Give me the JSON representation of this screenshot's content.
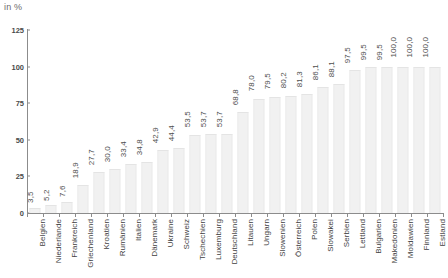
{
  "unit_label": "in %",
  "colors": {
    "bar_fill": "#f1f1f1",
    "bar_edge": "#e7e7e7",
    "axis": "#8c8c8c",
    "text": "#3f3f3f"
  },
  "chart_data": {
    "type": "bar",
    "title": "",
    "subtitle": "in %",
    "xlabel": "",
    "ylabel": "in %",
    "ylim": [
      0,
      125
    ],
    "yticks": [
      0,
      25,
      50,
      75,
      100,
      125
    ],
    "ytick_labels": [
      "0",
      "25",
      "50",
      "75",
      "100",
      "125"
    ],
    "grid": false,
    "legend": null,
    "value_label_decimal_separator": ",",
    "categories": [
      "Belgien",
      "Niederlande",
      "Frankreich",
      "Griechenland",
      "Kroatien",
      "Rumänien",
      "Italien",
      "Dänemark",
      "Ukraine",
      "Schweiz",
      "Tschechien",
      "Luxemburg",
      "Deutschland",
      "Litauen",
      "Ungarn",
      "Slowenien",
      "Österreich",
      "Polen",
      "Slowakei",
      "Serbien",
      "Lettland",
      "Bulgarien",
      "Makedonien",
      "Moldawien",
      "Finnland",
      "Estland"
    ],
    "values": [
      3.5,
      5.2,
      7.6,
      18.9,
      27.7,
      30.0,
      33.4,
      34.8,
      42.9,
      44.4,
      53.5,
      53.7,
      53.7,
      68.8,
      78.0,
      79.5,
      80.2,
      81.3,
      86.1,
      88.1,
      97.5,
      99.5,
      99.5,
      100.0,
      100.0,
      100.0
    ],
    "value_labels": [
      "3,5",
      "5,2",
      "7,6",
      "18,9",
      "27,7",
      "30,0",
      "33,4",
      "34,8",
      "42,9",
      "44,4",
      "53,5",
      "53,7",
      "53,7",
      "68,8",
      "78,0",
      "79,5",
      "80,2",
      "81,3",
      "86,1",
      "88,1",
      "97,5",
      "99,5",
      "99,5",
      "100,0",
      "100,0",
      "100,0"
    ]
  }
}
